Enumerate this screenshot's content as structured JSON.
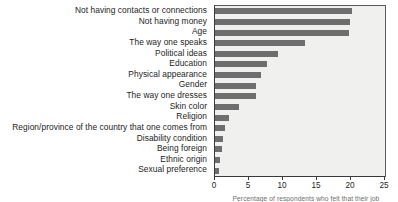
{
  "chart_data": {
    "type": "bar",
    "orientation": "horizontal",
    "title": "",
    "xlabel": "Percentage of respondents who felt that their job",
    "ylabel": "",
    "xlim": [
      0,
      25
    ],
    "xticks": [
      0,
      5,
      10,
      15,
      20,
      25
    ],
    "xtick_labels": [
      "0",
      "5",
      "10",
      "15",
      "20",
      "25"
    ],
    "grid": false,
    "legend": false,
    "bar_color": "#6e6e6e",
    "plot_background": "#f0f0ee",
    "categories": [
      "Not having contacts or connections",
      "Not having money",
      "Age",
      "The way one speaks",
      "Political ideas",
      "Education",
      "Physical appearance",
      "Gender",
      "The way one dresses",
      "Skin color",
      "Religion",
      "Region/province of the country that one comes from",
      "Disability condition",
      "Being foreign",
      "Ethnic origin",
      "Sexual preference"
    ],
    "values": [
      20.1,
      19.9,
      19.7,
      13.2,
      9.2,
      7.7,
      6.7,
      6.1,
      6.0,
      3.6,
      2.0,
      1.5,
      1.2,
      1.0,
      0.7,
      0.6
    ]
  }
}
